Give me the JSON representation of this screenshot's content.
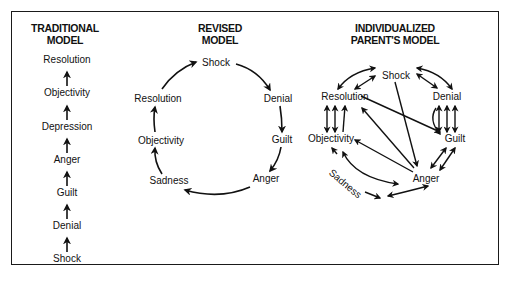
{
  "figure": {
    "panels": [
      {
        "id": "traditional",
        "title_line1": "TRADITIONAL",
        "title_line2": "MODEL",
        "stages_top_to_bottom": [
          "Resolution",
          "Objectivity",
          "Depression",
          "Anger",
          "Guilt",
          "Denial",
          "Shock"
        ],
        "flow": "linear upward from Shock to Resolution"
      },
      {
        "id": "revised",
        "title_line1": "REVISED",
        "title_line2": "MODEL",
        "stages": {
          "shock": "Shock",
          "denial": "Denial",
          "guilt": "Guilt",
          "anger": "Anger",
          "sadness": "Sadness",
          "objectivity": "Objectivity",
          "resolution": "Resolution"
        },
        "flow": "clockwise cycle: Shock → Denial → Guilt → Anger → Sadness → Objectivity → Resolution → Shock"
      },
      {
        "id": "individualized",
        "title_line1": "INDIVIDUALIZED",
        "title_line2": "PARENT'S MODEL",
        "stages": {
          "shock": "Shock",
          "denial": "Denial",
          "guilt": "Guilt",
          "anger": "Anger",
          "sadness": "Sadness",
          "objectivity": "Objectivity",
          "resolution": "Resolution"
        },
        "flow": "bidirectional arrows between stages in any order"
      }
    ],
    "caption": ""
  }
}
